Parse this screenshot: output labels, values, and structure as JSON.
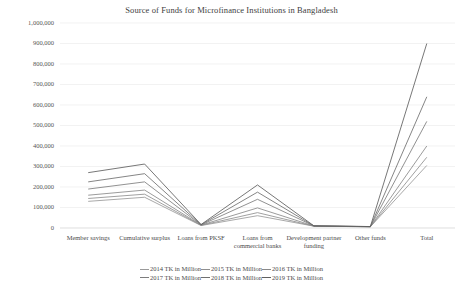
{
  "chart_data": {
    "type": "line",
    "title": "Source of Funds for Microfinance Institutions in Bangladesh",
    "xlabel": "",
    "ylabel": "",
    "ylim": [
      0,
      1000000
    ],
    "ytick_labels": [
      "1,000,000",
      "900,000",
      "800,000",
      "700,000",
      "600,000",
      "500,000",
      "400,000",
      "300,000",
      "200,000",
      "100,000",
      "0"
    ],
    "ytick_values": [
      1000000,
      900000,
      800000,
      700000,
      600000,
      500000,
      400000,
      300000,
      200000,
      100000,
      0
    ],
    "grid": true,
    "legend_position": "bottom",
    "categories": [
      "Member savings",
      "Cumulative surplus",
      "Loans from PKSF",
      "Loans from commercial banks",
      "Development partner funding",
      "Other funds",
      "Total"
    ],
    "series": [
      {
        "name": "2014 TK in Million",
        "color": "#9a9a9a",
        "values": [
          130000,
          150000,
          12000,
          60000,
          9000,
          6000,
          305000
        ]
      },
      {
        "name": "2015 TK in Million",
        "color": "#8f8f8f",
        "values": [
          144000,
          165000,
          13000,
          75000,
          9000,
          6000,
          345000
        ]
      },
      {
        "name": "2016 TK in Million",
        "color": "#898989",
        "values": [
          160000,
          185000,
          14000,
          98000,
          9500,
          6500,
          400000
        ]
      },
      {
        "name": "2017 TK in Million",
        "color": "#7d7d7d",
        "values": [
          190000,
          225000,
          15000,
          140000,
          10000,
          6500,
          520000
        ]
      },
      {
        "name": "2018 TK in Million",
        "color": "#6f6f6f",
        "values": [
          225000,
          265000,
          16000,
          175000,
          10000,
          7000,
          640000
        ]
      },
      {
        "name": "2019 TK in Million",
        "color": "#5f5f5f",
        "values": [
          270000,
          312000,
          17000,
          210000,
          10500,
          7000,
          900000
        ]
      }
    ]
  },
  "legend_rows": [
    [
      "2014 TK in Million",
      "2015 TK in Million",
      "2016 TK in Million"
    ],
    [
      "2017 TK in Million",
      "2018 TK in Million",
      "2019 TK in Million"
    ]
  ]
}
